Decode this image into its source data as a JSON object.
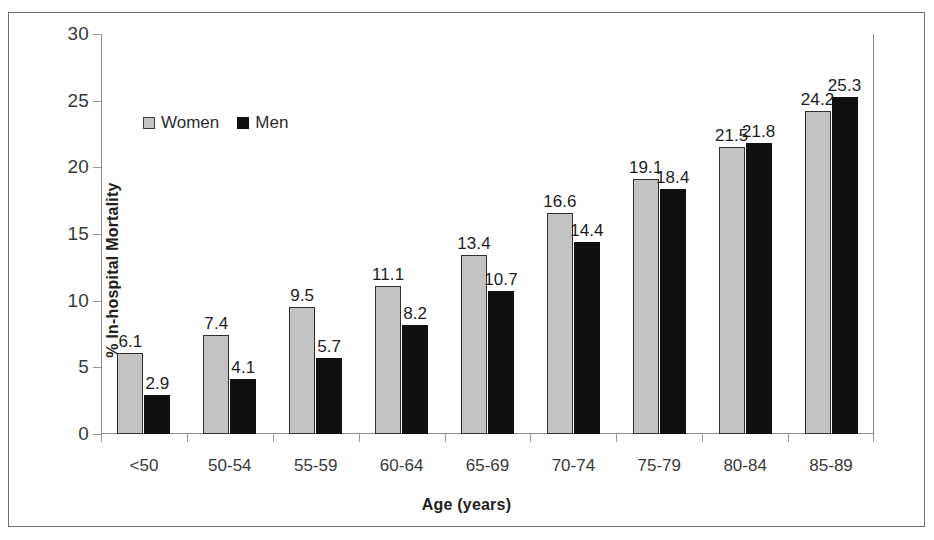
{
  "chart_data": {
    "type": "bar",
    "title": "",
    "xlabel": "Age (years)",
    "ylabel": "% In-hospital Mortality",
    "categories": [
      "<50",
      "50-54",
      "55-59",
      "60-64",
      "65-69",
      "70-74",
      "75-79",
      "80-84",
      "85-89"
    ],
    "series": [
      {
        "name": "Women",
        "color": "#c3c3c3",
        "values": [
          6.1,
          7.4,
          9.5,
          11.1,
          13.4,
          16.6,
          19.1,
          21.5,
          24.2
        ],
        "labels": [
          "6.1",
          "7.4",
          "9.5",
          "11.1",
          "13.4",
          "16.6",
          "19.1",
          "21.5",
          "24.2"
        ]
      },
      {
        "name": "Men",
        "color": "#101010",
        "values": [
          2.9,
          4.1,
          5.7,
          8.2,
          10.7,
          14.4,
          18.4,
          21.8,
          25.3
        ],
        "labels": [
          "2.9",
          "4.1",
          "5.7",
          "8.2",
          "10.7",
          "14.4",
          "18.4",
          "21.8",
          "25.3"
        ]
      }
    ],
    "ylim": [
      0,
      30
    ],
    "yticks": [
      0,
      5,
      10,
      15,
      20,
      25,
      30
    ],
    "ytick_labels": [
      "0",
      "5",
      "10",
      "15",
      "20",
      "25",
      "30"
    ],
    "grid": false,
    "legend_position": "upper-left-inside"
  },
  "legend": {
    "entries": [
      {
        "label": "Women",
        "swatch": "legend-swatch-women"
      },
      {
        "label": "Men",
        "swatch": "legend-swatch-men"
      }
    ]
  },
  "axes": {
    "x_title": "Age (years)",
    "y_title": "% In-hospital Mortality"
  }
}
